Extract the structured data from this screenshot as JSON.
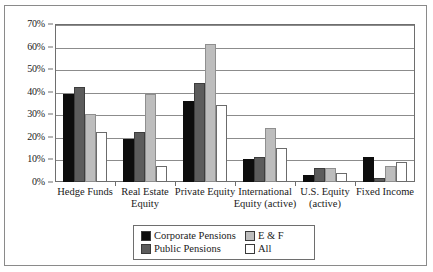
{
  "chart_data": {
    "type": "bar",
    "title": "",
    "subtitle": "",
    "xlabel": "",
    "ylabel": "",
    "ylim": [
      0,
      70
    ],
    "ytick_labels": [
      "0%",
      "10%",
      "20%",
      "30%",
      "40%",
      "50%",
      "60%",
      "70%"
    ],
    "ytick_values": [
      0,
      10,
      20,
      30,
      40,
      50,
      60,
      70
    ],
    "grid": true,
    "legend_position": "bottom-center",
    "categories": [
      "Hedge Funds",
      "Real Estate Equity",
      "Private Equity",
      "International Equity (active)",
      "U.S. Equity (active)",
      "Fixed Income"
    ],
    "category_lines": [
      [
        "Hedge Funds"
      ],
      [
        "Real Estate",
        "Equity"
      ],
      [
        "Private Equity"
      ],
      [
        "International",
        "Equity (active)"
      ],
      [
        "U.S. Equity",
        "(active)"
      ],
      [
        "Fixed Income"
      ]
    ],
    "series": [
      {
        "name": "Corporate Pensions",
        "color": "#0d0d0d",
        "values": [
          39,
          19,
          36,
          10,
          3,
          11
        ]
      },
      {
        "name": "Public Pensions",
        "color": "#5c5c5c",
        "values": [
          42,
          22,
          44,
          11,
          6,
          2
        ]
      },
      {
        "name": "E & F",
        "color": "#bdbdbd",
        "values": [
          30,
          39,
          61,
          24,
          6,
          7
        ]
      },
      {
        "name": "All",
        "color": "#ffffff",
        "values": [
          22,
          7,
          34,
          15,
          4,
          9
        ]
      }
    ]
  },
  "legend": {
    "entries": [
      {
        "label": "Corporate Pensions",
        "color": "#0d0d0d"
      },
      {
        "label": "E & F",
        "color": "#bdbdbd"
      },
      {
        "label": "Public Pensions",
        "color": "#5c5c5c"
      },
      {
        "label": "All",
        "color": "#ffffff"
      }
    ]
  }
}
